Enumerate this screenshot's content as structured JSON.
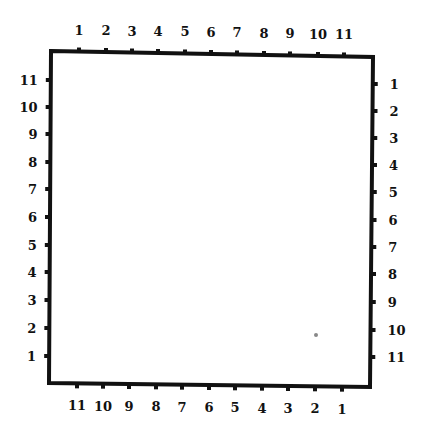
{
  "diagram": {
    "type": "pin-numbered-square-package-outline",
    "colors": {
      "outline": "#111111",
      "background": "#ffffff",
      "dot": "#888888"
    },
    "top_labels": [
      "1",
      "2",
      "3",
      "4",
      "5",
      "6",
      "7",
      "8",
      "9",
      "10",
      "11"
    ],
    "right_labels": [
      "1",
      "2",
      "3",
      "4",
      "5",
      "6",
      "7",
      "8",
      "9",
      "10",
      "11"
    ],
    "bottom_labels": [
      "11",
      "10",
      "9",
      "8",
      "7",
      "6",
      "5",
      "4",
      "3",
      "2",
      "1"
    ],
    "left_labels": [
      "11",
      "10",
      "9",
      "8",
      "7",
      "6",
      "5",
      "4",
      "3",
      "2",
      "1"
    ],
    "mark": {
      "x": 316,
      "y": 335
    }
  }
}
